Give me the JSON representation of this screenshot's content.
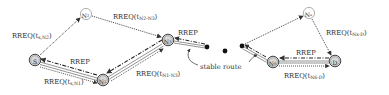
{
  "diagram": {
    "type": "routing-protocol-flow",
    "nodes": [
      {
        "id": "S",
        "label": "S",
        "sub": "",
        "x": 35,
        "y": 60,
        "style": "bold"
      },
      {
        "id": "N1",
        "label": "N",
        "sub": "1",
        "x": 103,
        "y": 80,
        "style": "bold"
      },
      {
        "id": "N2",
        "label": "N",
        "sub": "2",
        "x": 86,
        "y": 14,
        "style": "light"
      },
      {
        "id": "N3",
        "label": "N",
        "sub": "3",
        "x": 168,
        "y": 40,
        "style": "bold"
      },
      {
        "id": "Nx",
        "label": "N",
        "sub": "x",
        "x": 309,
        "y": 13,
        "style": "light"
      },
      {
        "id": "N6",
        "label": "N",
        "sub": "6",
        "x": 273,
        "y": 62,
        "style": "bold"
      },
      {
        "id": "D",
        "label": "D",
        "sub": "",
        "x": 335,
        "y": 61,
        "style": "bold"
      }
    ],
    "ellipsis_dots": [
      {
        "x": 207,
        "y": 47
      },
      {
        "x": 225,
        "y": 51
      },
      {
        "x": 242,
        "y": 46
      }
    ],
    "edge_labels": [
      {
        "id": "rreq-s-n2",
        "main": "RREQ(t",
        "sub": "s,N2",
        "close": ")",
        "x": 12,
        "y": 38
      },
      {
        "id": "rreq-n2-n3",
        "main": "RREQ(t",
        "sub": "N2-N3",
        "close": ")",
        "x": 113,
        "y": 19
      },
      {
        "id": "rrep-left",
        "main": "RREP",
        "sub": "",
        "close": "",
        "x": 70,
        "y": 64
      },
      {
        "id": "rreq-s-n1",
        "main": "RREQ(t",
        "sub": "s,N1",
        "close": ")",
        "x": 44,
        "y": 84
      },
      {
        "id": "rreq-n1-n3",
        "main": "RREQ(t",
        "sub": "N1-N3",
        "close": ")",
        "x": 136,
        "y": 76
      },
      {
        "id": "rrep-mid",
        "main": "RREP",
        "sub": "",
        "close": "",
        "x": 178,
        "y": 35
      },
      {
        "id": "rreq-nx-d",
        "main": "RREQ(t",
        "sub": "Nx-D",
        "close": ")",
        "x": 326,
        "y": 35
      },
      {
        "id": "rrep-right",
        "main": "RREP",
        "sub": "",
        "close": "",
        "x": 296,
        "y": 55
      },
      {
        "id": "rreq-n6-d",
        "main": "RREQ(t",
        "sub": "N6-D",
        "close": ")",
        "x": 284,
        "y": 78
      }
    ],
    "annotation": {
      "text": "stable route",
      "x": 200,
      "y": 69
    },
    "legend_colors": {
      "rreq_dotted": "#333333",
      "rrep_dashdot": "#222222",
      "stable_route_double": "#555555",
      "node_light_stroke": "#9a9a9a",
      "node_bold_stroke": "#444444",
      "node_bold_fill": "#d8d8d8"
    }
  }
}
